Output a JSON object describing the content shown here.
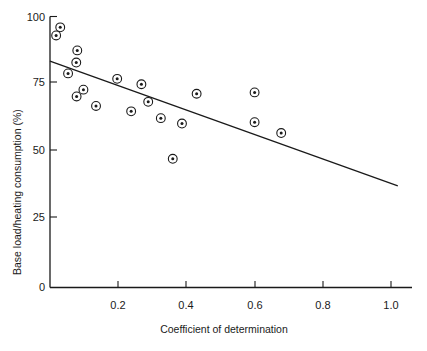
{
  "chart_data": {
    "type": "scatter",
    "title": "",
    "xlabel": "Coefficient of determination",
    "ylabel": "Base load/heating consumption (%)",
    "xlim": [
      0,
      1.06
    ],
    "ylim": [
      0,
      100
    ],
    "xticks": [
      0.2,
      0.4,
      0.6,
      0.8,
      1.0
    ],
    "xtick_labels": [
      "0.2",
      "0.4",
      "0.6",
      "0.8",
      "1.0"
    ],
    "yticks": [
      0,
      25,
      50,
      75,
      100
    ],
    "ytick_labels": [
      "0",
      "25",
      "50",
      "75",
      "100"
    ],
    "grid": false,
    "legend": null,
    "marker_style": "circle-with-dot",
    "points": [
      {
        "x": 0.03,
        "y": 96.0
      },
      {
        "x": 0.018,
        "y": 93.0
      },
      {
        "x": 0.08,
        "y": 87.5
      },
      {
        "x": 0.077,
        "y": 83.0
      },
      {
        "x": 0.053,
        "y": 79.0
      },
      {
        "x": 0.197,
        "y": 77.0
      },
      {
        "x": 0.268,
        "y": 75.0
      },
      {
        "x": 0.098,
        "y": 73.0
      },
      {
        "x": 0.078,
        "y": 70.5
      },
      {
        "x": 0.288,
        "y": 68.5
      },
      {
        "x": 0.43,
        "y": 71.5
      },
      {
        "x": 0.6,
        "y": 72.0
      },
      {
        "x": 0.135,
        "y": 67.0
      },
      {
        "x": 0.238,
        "y": 65.0
      },
      {
        "x": 0.325,
        "y": 62.5
      },
      {
        "x": 0.6,
        "y": 61.0
      },
      {
        "x": 0.387,
        "y": 60.5
      },
      {
        "x": 0.678,
        "y": 57.0
      },
      {
        "x": 0.36,
        "y": 47.5
      }
    ],
    "fit_line": {
      "label": "regression line",
      "x_start": 0.0,
      "y_start": 83.5,
      "x_end": 1.02,
      "y_end": 37.5
    }
  },
  "axis": {
    "y_title": "Base load/heating consumption (%)",
    "x_title": "Coefficient of determination"
  }
}
